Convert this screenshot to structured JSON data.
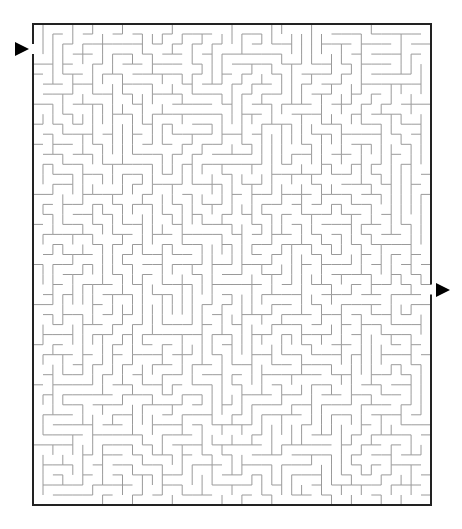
{
  "puzzle": {
    "type": "maze",
    "title": "Maze",
    "grid": {
      "cols": 40,
      "rows": 48
    },
    "bounds": {
      "left": 33,
      "top": 24,
      "right": 431,
      "bottom": 505
    },
    "entry": {
      "side": "left",
      "row": 2,
      "arrow_label": "Start"
    },
    "exit": {
      "side": "right",
      "row": 26,
      "arrow_label": "Finish"
    },
    "seed": 7319
  },
  "colors": {
    "background": "#ffffff",
    "border": "#222222",
    "walls": "#9a9a9a",
    "arrow": "#000000"
  }
}
